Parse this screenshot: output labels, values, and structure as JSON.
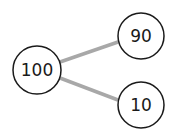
{
  "diagram": {
    "type": "number-bond",
    "whole": {
      "label": "100",
      "cx": 37,
      "cy": 70,
      "r": 24
    },
    "parts": [
      {
        "label": "90",
        "cx": 141,
        "cy": 36,
        "r": 23
      },
      {
        "label": "10",
        "cx": 141,
        "cy": 105,
        "r": 23
      }
    ],
    "edges": [
      {
        "from": "100",
        "to": "90",
        "x1": 60,
        "y1": 62,
        "x2": 118,
        "y2": 42
      },
      {
        "from": "100",
        "to": "10",
        "x1": 60,
        "y1": 78,
        "x2": 118,
        "y2": 100
      }
    ],
    "colors": {
      "edge": "#a8a8a8",
      "circle_stroke": "#1a1a1a",
      "circle_fill": "#ffffff"
    }
  }
}
